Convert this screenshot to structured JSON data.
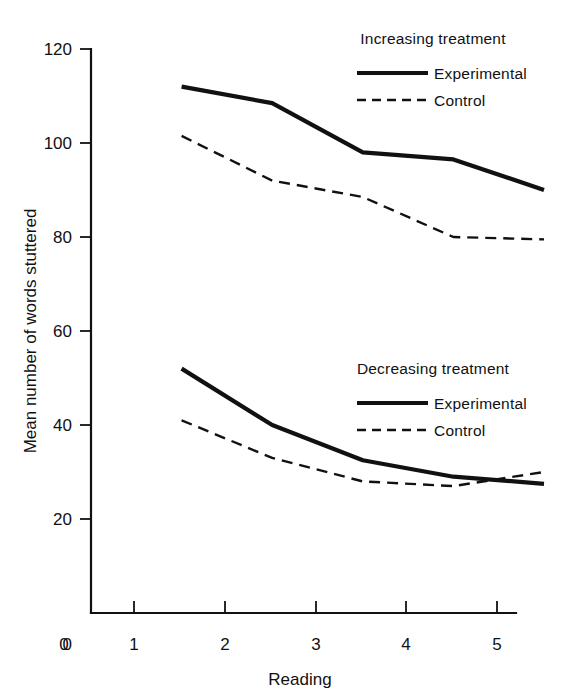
{
  "chart_data": {
    "type": "line",
    "title": "",
    "xlabel": "Reading",
    "ylabel": "Mean number of words stuttered",
    "x": [
      1,
      2,
      3,
      4,
      5
    ],
    "xtick_labels": [
      "0",
      "1",
      "2",
      "3",
      "4",
      "5"
    ],
    "ytick_labels": [
      "0",
      "20",
      "40",
      "60",
      "80",
      "100",
      "120"
    ],
    "xlim": [
      0,
      5.4
    ],
    "ylim": [
      0,
      120
    ],
    "grid": false,
    "legend_position": "right-inside",
    "series": [
      {
        "name": "Experimental",
        "group": "Increasing treatment",
        "style": "solid",
        "values": [
          112,
          108.5,
          98,
          96.5,
          90
        ]
      },
      {
        "name": "Control",
        "group": "Increasing treatment",
        "style": "dashed",
        "values": [
          101.5,
          92,
          88.5,
          80,
          79.5
        ]
      },
      {
        "name": "Experimental",
        "group": "Decreasing treatment",
        "style": "solid",
        "values": [
          52,
          40,
          32.5,
          29,
          27.5
        ]
      },
      {
        "name": "Control",
        "group": "Decreasing treatment",
        "style": "dashed",
        "values": [
          41,
          33,
          28,
          27,
          30
        ]
      }
    ],
    "legends": [
      {
        "title": "Increasing treatment",
        "entries": [
          {
            "label": "Experimental",
            "style": "solid"
          },
          {
            "label": "Control",
            "style": "dashed"
          }
        ]
      },
      {
        "title": "Decreasing treatment",
        "entries": [
          {
            "label": "Experimental",
            "style": "solid"
          },
          {
            "label": "Control",
            "style": "dashed"
          }
        ]
      }
    ],
    "colors": {
      "ink": "#111111",
      "background": "#ffffff"
    }
  },
  "axes": {
    "y_ticks": [
      {
        "label": "120",
        "value": 120
      },
      {
        "label": "100",
        "value": 100
      },
      {
        "label": "80",
        "value": 80
      },
      {
        "label": "60",
        "value": 60
      },
      {
        "label": "40",
        "value": 40
      },
      {
        "label": "20",
        "value": 20
      },
      {
        "label": "0",
        "value": 0
      }
    ],
    "x_ticks": [
      {
        "label": "0",
        "value": 0
      },
      {
        "label": "1",
        "value": 1
      },
      {
        "label": "2",
        "value": 2
      },
      {
        "label": "3",
        "value": 3
      },
      {
        "label": "4",
        "value": 4
      },
      {
        "label": "5",
        "value": 5
      }
    ],
    "x_axis_title": "Reading",
    "y_axis_title": "Mean number of words stuttered"
  },
  "legend_top": {
    "title": "Increasing treatment",
    "experimental_label": "Experimental",
    "control_label": "Control"
  },
  "legend_bottom": {
    "title": "Decreasing treatment",
    "experimental_label": "Experimental",
    "control_label": "Control"
  }
}
